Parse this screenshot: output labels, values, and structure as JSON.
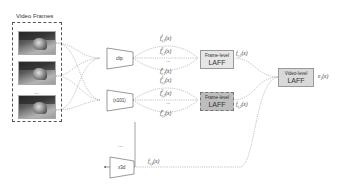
{
  "diagram": {
    "input_title": "Video Frames",
    "frames": [
      {
        "id": "frame-1"
      },
      {
        "id": "frame-2"
      },
      {
        "id": "frame-3"
      }
    ],
    "frames_ellipsis": "...",
    "encoders": [
      {
        "label": "clip"
      },
      {
        "label": "(x101)"
      },
      {
        "label": "x3d"
      }
    ],
    "encoders_ellipsis": "...",
    "frame_feature_labels": {
      "row1": [
        "f^1_{v,1}(x)",
        "f^2_{v,1}(x)",
        "...",
        "f^n_{v,1}(x)"
      ],
      "row2": [
        "f^1_{v,2}(x)",
        "f^2_{v,2}(x)",
        "...",
        "f^n_{v,2}(x)"
      ]
    },
    "frame_feature_display": {
      "r1a": "f",
      "r1a_sup": "1",
      "r1a_sub": "v,1",
      "r1a_arg": "(x)",
      "r1b": "f",
      "r1b_sup": "2",
      "r1b_sub": "v,1",
      "r1b_arg": "(x)",
      "r1c": "...",
      "r1d": "f",
      "r1d_sup": "n",
      "r1d_sub": "v,1",
      "r1d_arg": "(x)",
      "r2a": "f",
      "r2a_sup": "1",
      "r2a_sub": "v,2",
      "r2a_arg": "(x)",
      "r2b": "f",
      "r2b_sup": "2",
      "r2b_sub": "v,2",
      "r2b_arg": "(x)",
      "r2c": "...",
      "r2d": "f",
      "r2d_sup": "n",
      "r2d_sub": "v,2",
      "r2d_arg": "(x)"
    },
    "frame_laff": [
      {
        "line1": "Frame-level",
        "line2": "LAFF",
        "fill": "#e6e6e6"
      },
      {
        "line1": "Frame-level",
        "line2": "LAFF",
        "fill": "#bdbdbd"
      }
    ],
    "video_laff": {
      "line1": "Video-level",
      "line2": "LAFF",
      "fill": "#d9d9d9"
    },
    "pooled_features": [
      {
        "f": "f",
        "sub": "v,1",
        "arg": "(x)"
      },
      {
        "f": "f",
        "sub": "v,2",
        "arg": "(x)"
      },
      {
        "f": "f",
        "sub": "v,k",
        "subsub": "3",
        "arg": "(x)"
      }
    ],
    "output": {
      "e": "e",
      "sub": "1",
      "arg": "(x)"
    }
  }
}
